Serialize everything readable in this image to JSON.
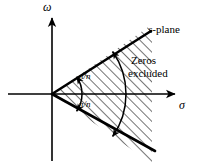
{
  "figure": {
    "title_label": "s-plane",
    "title_label_italic_part": "s",
    "title_label_rest": "-plane",
    "region_label_line1": "Zeros",
    "region_label_line2": "excluded",
    "axis_vertical_label": "ω",
    "axis_horizontal_label": "σ",
    "angle_label_upper": "π/n",
    "angle_label_lower": "π/n",
    "colors": {
      "ink": "#000000",
      "background": "#ffffff",
      "hatch": "#000000"
    },
    "geometry": {
      "origin_x": 52,
      "origin_y": 94,
      "wedge_half_angle_deg": 35,
      "vertical_axis_top_y": 16,
      "vertical_axis_bottom_y": 161,
      "horizontal_axis_left_x": 8,
      "horizontal_axis_right_x": 177,
      "inner_arc_radius": 30,
      "outer_arc_radius": 74
    }
  }
}
